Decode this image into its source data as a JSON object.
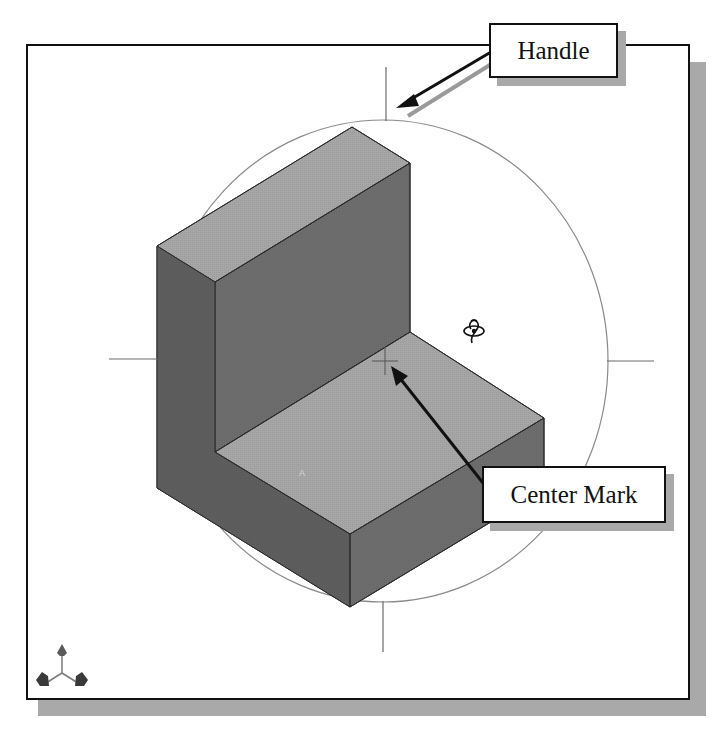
{
  "figure": {
    "colors": {
      "frame_border": "#111111",
      "frame_shadow": "#a9a9a9",
      "face_top": "#a6a6a6",
      "face_front": "#6d6d6d",
      "face_side": "#5e5e5e",
      "orbit_circle": "#8a8a8a",
      "triad": "#4a4a4a"
    }
  },
  "callouts": {
    "handle": {
      "label": "Handle"
    },
    "center_mark": {
      "label": "Center Mark"
    }
  },
  "viewport": {
    "orbit_cursor_icon": "rotate-view-icon",
    "triad_icon": "reference-triad-icon",
    "face_label": "A"
  }
}
